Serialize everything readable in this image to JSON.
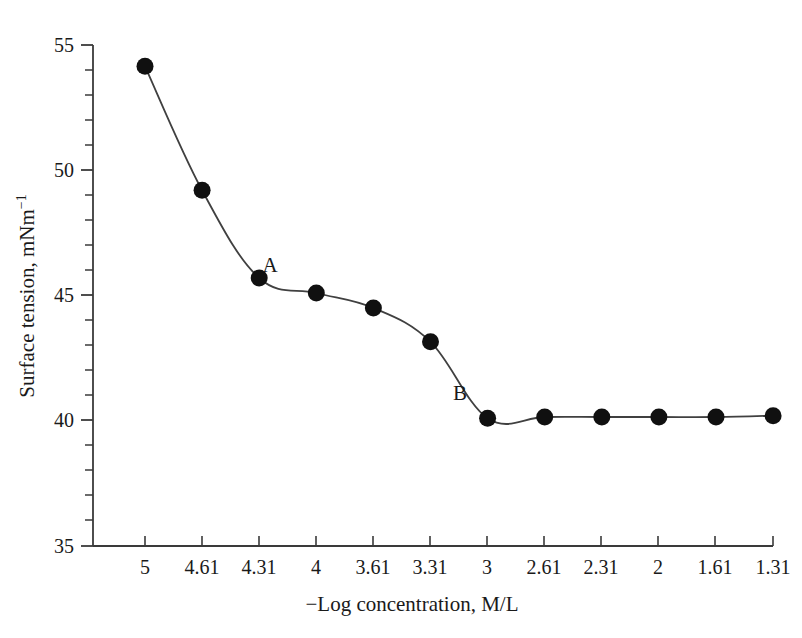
{
  "chart_data": {
    "type": "line",
    "title": "",
    "subtitle": "",
    "xlabel": "−Log concentration, M/L",
    "ylabel": "Surface tension, mNm⁻¹",
    "ylabel_base": "Surface tension, mNm",
    "ylabel_exponent": "−1",
    "x_tick_labels": [
      "5",
      "4.61",
      "4.31",
      "4",
      "3.61",
      "3.31",
      "3",
      "2.61",
      "2.31",
      "2",
      "1.61",
      "1.31"
    ],
    "y_tick_labels": [
      "35",
      "40",
      "45",
      "50",
      "55"
    ],
    "y_major_ticks": [
      35,
      40,
      45,
      50,
      55
    ],
    "ylim": [
      35,
      55
    ],
    "y_minor_per_major": 5,
    "grid": false,
    "legend": false,
    "marker": "filled-circle",
    "marker_color": "#101010",
    "line_color": "#404040",
    "categories": [
      "5",
      "4.61",
      "4.31",
      "4",
      "3.61",
      "3.31",
      "3",
      "2.61",
      "2.31",
      "2",
      "1.61",
      "1.31"
    ],
    "values": [
      54.15,
      49.2,
      45.7,
      45.1,
      44.5,
      43.15,
      40.1,
      40.15,
      40.15,
      40.15,
      40.15,
      40.2
    ],
    "points": [
      {
        "x_label": "5",
        "y": 54.15
      },
      {
        "x_label": "4.61",
        "y": 49.2
      },
      {
        "x_label": "4.31",
        "y": 45.7
      },
      {
        "x_label": "4",
        "y": 45.1
      },
      {
        "x_label": "3.61",
        "y": 44.5
      },
      {
        "x_label": "3.31",
        "y": 43.15
      },
      {
        "x_label": "3",
        "y": 40.1
      },
      {
        "x_label": "2.61",
        "y": 40.15
      },
      {
        "x_label": "2.31",
        "y": 40.15
      },
      {
        "x_label": "2",
        "y": 40.15
      },
      {
        "x_label": "1.61",
        "y": 40.15
      },
      {
        "x_label": "1.31",
        "y": 40.2
      }
    ],
    "annotations": [
      {
        "label": "A",
        "near_x_label": "4.31",
        "near_y": 45.7
      },
      {
        "label": "B",
        "near_x_label": "3",
        "near_y": 40.1
      }
    ]
  },
  "axis": {
    "y_ticks": {
      "t0": "35",
      "t1": "40",
      "t2": "45",
      "t3": "50",
      "t4": "55"
    },
    "x_ticks": {
      "t0": "5",
      "t1": "4.61",
      "t2": "4.31",
      "t3": "4",
      "t4": "3.61",
      "t5": "3.31",
      "t6": "3",
      "t7": "2.61",
      "t8": "2.31",
      "t9": "2",
      "t10": "1.61",
      "t11": "1.31"
    }
  },
  "annotations": {
    "a": "A",
    "b": "B"
  },
  "colors": {
    "background": "#ffffff",
    "axis": "#3a3a3a",
    "marker": "#101010",
    "line": "#404040",
    "text": "#1a1a1a"
  }
}
